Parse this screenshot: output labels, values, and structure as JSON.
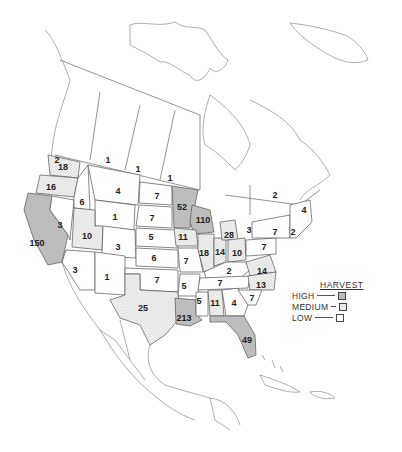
{
  "map": {
    "title": "Harvest by state/province, North America",
    "legend": {
      "title": "HARVEST",
      "items": [
        {
          "label": "HIGH",
          "level": "high",
          "symbol": "gray-shaded-box"
        },
        {
          "label": "MEDIUM",
          "level": "medium",
          "symbol": "stippled-box"
        },
        {
          "label": "LOW",
          "level": "low",
          "symbol": "empty-box"
        }
      ]
    },
    "colors": {
      "high": "#bdbdbd",
      "medium": "#e8e8e8",
      "low": "#ffffff",
      "border": "#555555",
      "text": "#222222"
    },
    "regions": [
      {
        "name": "British Columbia (south)",
        "value": "2",
        "level": "low",
        "x": 57,
        "y": 160
      },
      {
        "name": "Alberta",
        "value": "1",
        "level": "low",
        "x": 108,
        "y": 160
      },
      {
        "name": "Saskatchewan",
        "value": "1",
        "level": "low",
        "x": 138,
        "y": 169
      },
      {
        "name": "Manitoba",
        "value": "1",
        "level": "low",
        "x": 170,
        "y": 178
      },
      {
        "name": "Ontario/Quebec",
        "value": "2",
        "level": "low",
        "x": 275,
        "y": 195
      },
      {
        "name": "Maine/Maritimes",
        "value": "4",
        "level": "low",
        "x": 304,
        "y": 210
      },
      {
        "name": "Washington",
        "value": "18",
        "level": "medium",
        "x": 63,
        "y": 167
      },
      {
        "name": "Oregon",
        "value": "16",
        "level": "medium",
        "x": 51,
        "y": 187
      },
      {
        "name": "California",
        "value": "150",
        "level": "high",
        "x": 37,
        "y": 243
      },
      {
        "name": "Nevada",
        "value": "3",
        "level": "low",
        "x": 60,
        "y": 225
      },
      {
        "name": "Idaho",
        "value": "6",
        "level": "low",
        "x": 82,
        "y": 202
      },
      {
        "name": "Montana",
        "value": "4",
        "level": "low",
        "x": 118,
        "y": 191
      },
      {
        "name": "Wyoming",
        "value": "1",
        "level": "low",
        "x": 115,
        "y": 217
      },
      {
        "name": "Utah",
        "value": "10",
        "level": "medium",
        "x": 87,
        "y": 236
      },
      {
        "name": "Colorado",
        "value": "3",
        "level": "low",
        "x": 118,
        "y": 247
      },
      {
        "name": "Arizona",
        "value": "3",
        "level": "low",
        "x": 75,
        "y": 270
      },
      {
        "name": "New Mexico",
        "value": "1",
        "level": "low",
        "x": 107,
        "y": 277
      },
      {
        "name": "North Dakota",
        "value": "7",
        "level": "low",
        "x": 157,
        "y": 196
      },
      {
        "name": "South Dakota",
        "value": "7",
        "level": "low",
        "x": 152,
        "y": 218
      },
      {
        "name": "Nebraska",
        "value": "5",
        "level": "low",
        "x": 151,
        "y": 237
      },
      {
        "name": "Kansas",
        "value": "6",
        "level": "low",
        "x": 154,
        "y": 258
      },
      {
        "name": "Oklahoma",
        "value": "7",
        "level": "low",
        "x": 157,
        "y": 280
      },
      {
        "name": "Texas",
        "value": "25",
        "level": "medium",
        "x": 143,
        "y": 308
      },
      {
        "name": "Minnesota",
        "value": "52",
        "level": "high",
        "x": 182,
        "y": 207
      },
      {
        "name": "Wisconsin",
        "value": "110",
        "level": "high",
        "x": 203,
        "y": 220
      },
      {
        "name": "Iowa",
        "value": "11",
        "level": "medium",
        "x": 183,
        "y": 237
      },
      {
        "name": "Missouri",
        "value": "7",
        "level": "low",
        "x": 186,
        "y": 261
      },
      {
        "name": "Arkansas",
        "value": "5",
        "level": "low",
        "x": 184,
        "y": 286
      },
      {
        "name": "Louisiana",
        "value": "213",
        "level": "high",
        "x": 184,
        "y": 318
      },
      {
        "name": "Mississippi",
        "value": "5",
        "level": "low",
        "x": 199,
        "y": 301
      },
      {
        "name": "Alabama",
        "value": "11",
        "level": "medium",
        "x": 215,
        "y": 303
      },
      {
        "name": "Georgia",
        "value": "4",
        "level": "low",
        "x": 234,
        "y": 303
      },
      {
        "name": "Florida",
        "value": "49",
        "level": "high",
        "x": 247,
        "y": 340
      },
      {
        "name": "Illinois",
        "value": "18",
        "level": "medium",
        "x": 204,
        "y": 253
      },
      {
        "name": "Indiana",
        "value": "14",
        "level": "medium",
        "x": 220,
        "y": 252
      },
      {
        "name": "Michigan",
        "value": "28",
        "level": "medium",
        "x": 229,
        "y": 235
      },
      {
        "name": "Ohio",
        "value": "10",
        "level": "medium",
        "x": 237,
        "y": 253
      },
      {
        "name": "Kentucky",
        "value": "2",
        "level": "low",
        "x": 229,
        "y": 271
      },
      {
        "name": "Tennessee",
        "value": "7",
        "level": "low",
        "x": 220,
        "y": 283
      },
      {
        "name": "Virginia",
        "value": "14",
        "level": "medium",
        "x": 262,
        "y": 271
      },
      {
        "name": "North Carolina",
        "value": "13",
        "level": "medium",
        "x": 261,
        "y": 285
      },
      {
        "name": "South Carolina",
        "value": "7",
        "level": "low",
        "x": 252,
        "y": 298
      },
      {
        "name": "Pennsylvania",
        "value": "7",
        "level": "low",
        "x": 264,
        "y": 247
      },
      {
        "name": "New York",
        "value": "7",
        "level": "low",
        "x": 275,
        "y": 232
      },
      {
        "name": "Ontario (south)",
        "value": "3",
        "level": "low",
        "x": 249,
        "y": 230
      },
      {
        "name": "New England",
        "value": "2",
        "level": "low",
        "x": 293,
        "y": 232
      }
    ]
  }
}
